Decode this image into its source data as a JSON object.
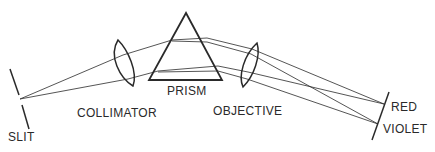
{
  "diagram": {
    "colors": {
      "ink": "#2a2a2a",
      "background": "#ffffff"
    },
    "labels": {
      "slit": "SLIT",
      "collimator": "COLLIMATOR",
      "prism": "PRISM",
      "objective": "OBJECTIVE",
      "red": "RED",
      "violet": "VIOLET"
    },
    "components": [
      {
        "name": "slit",
        "type": "aperture"
      },
      {
        "name": "collimator",
        "type": "lens"
      },
      {
        "name": "prism",
        "type": "triangular prism"
      },
      {
        "name": "objective",
        "type": "lens"
      },
      {
        "name": "focal-plane",
        "type": "screen",
        "ends": [
          "red",
          "violet"
        ]
      }
    ]
  }
}
